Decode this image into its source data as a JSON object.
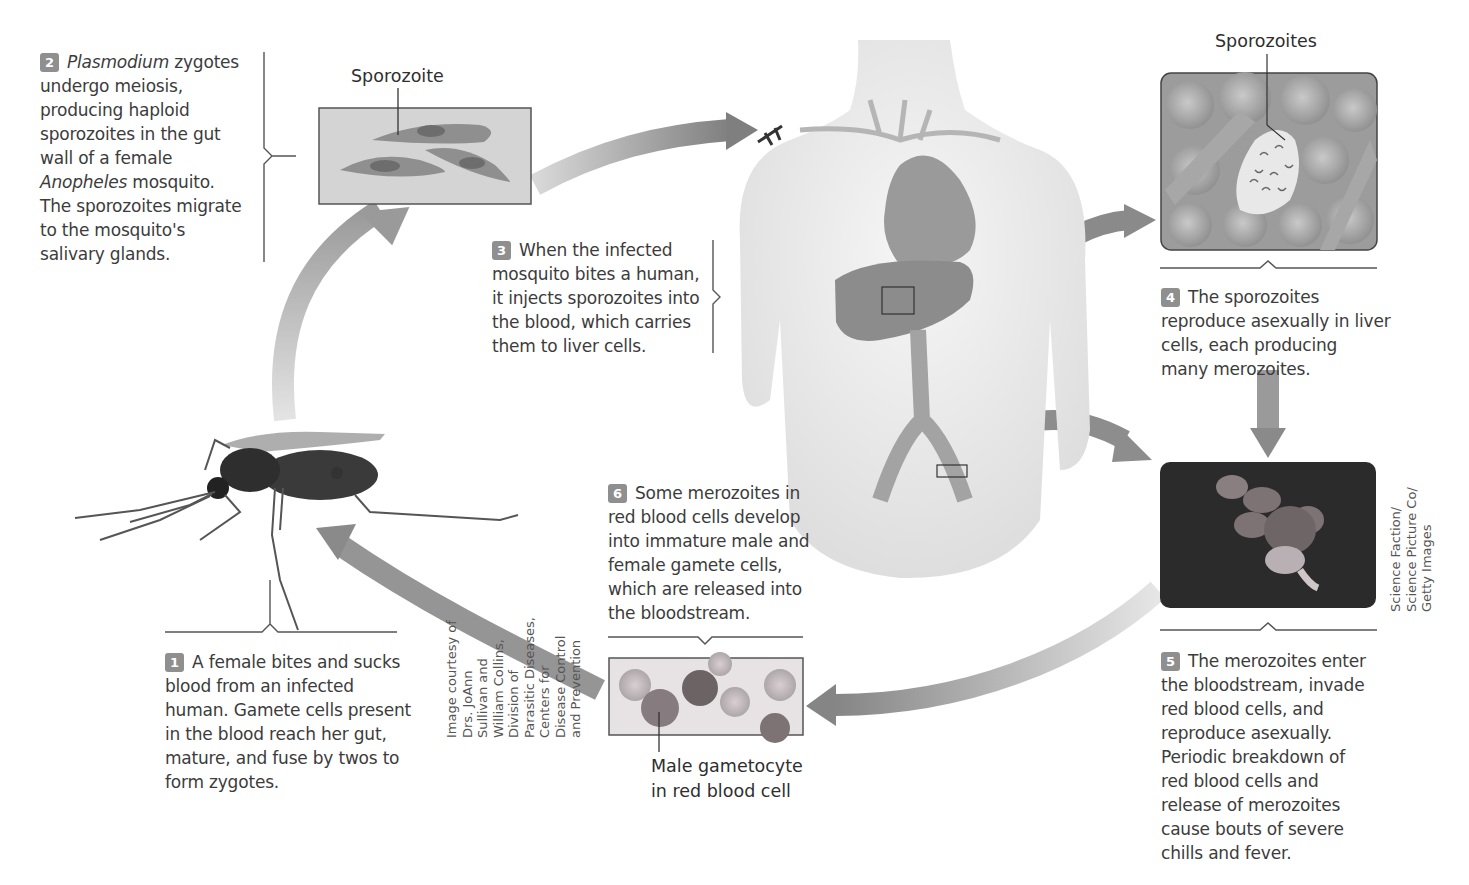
{
  "figure": {
    "topic": "Plasmodium life cycle (malaria)",
    "steps": [
      {
        "number": "1",
        "text": "A female bites and sucks blood from an infected human. Gamete cells present in the blood reach her gut, mature, and fuse by twos to form zygotes.",
        "lines": [
          "A female bites and sucks",
          "blood from an infected",
          "human. Gamete cells present",
          "in the blood reach her gut,",
          "mature, and fuse by twos to",
          "form zygotes."
        ]
      },
      {
        "number": "2",
        "italic_lead": "Plasmodium",
        "lead_rest": " zygotes",
        "lines": [
          "undergo meiosis,",
          "producing haploid",
          "sporozoites in the gut",
          "wall of a female"
        ],
        "italic_line": "Anopheles",
        "italic_line_rest": " mosquito.",
        "lines_after": [
          "The sporozoites migrate",
          "to the mosquito's",
          "salivary glands."
        ]
      },
      {
        "number": "3",
        "lines": [
          "When the infected",
          "mosquito bites a human,",
          "it injects sporozoites into",
          "the blood, which carries",
          "them to liver cells."
        ]
      },
      {
        "number": "4",
        "lines": [
          "The sporozoites",
          "reproduce asexually in liver",
          "cells, each producing",
          "many merozoites."
        ]
      },
      {
        "number": "5",
        "lines": [
          "The merozoites enter",
          "the bloodstream, invade",
          "red blood cells, and",
          "reproduce asexually.",
          "Periodic breakdown of",
          "red blood cells and",
          "release of merozoites",
          "cause bouts of severe",
          "chills and fever."
        ]
      },
      {
        "number": "6",
        "lines": [
          "Some merozoites in",
          "red blood cells develop",
          "into immature male and",
          "female gamete cells,",
          "which are released into",
          "the bloodstream."
        ]
      }
    ],
    "labels": {
      "sporozoite": "Sporozoite",
      "sporozoites": "Sporozoites",
      "male_gametocyte_1": "Male gametocyte",
      "male_gametocyte_2": "in red blood cell"
    },
    "credits": {
      "cdc": [
        "Image courtesy of",
        "Drs. JoAnn",
        "Sullivan and",
        "William Collins,",
        "Division of",
        "Parasitic Diseases,",
        "Centers for",
        "Disease Control",
        "and Prevention"
      ],
      "getty": [
        "Science Faction/",
        "Science Picture Co/",
        "Getty Images"
      ]
    },
    "colors": {
      "arrow": "#8a8a8a",
      "body": "#ececec",
      "organ": "#8c8c8c",
      "badge": "#8f8f8f",
      "photo_dark": "#2b2b2b"
    }
  }
}
